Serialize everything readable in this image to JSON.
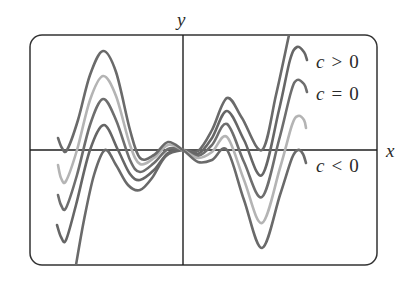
{
  "chart_data": {
    "type": "line",
    "title": "",
    "xlabel": "x",
    "ylabel": "y",
    "grid": false,
    "frame": {
      "x": 30,
      "y": 35,
      "width": 347,
      "height": 230,
      "radius": 12,
      "color": "#333333"
    },
    "origin_px": {
      "x": 183,
      "y": 150
    },
    "annotations": [
      {
        "text_var": "c",
        "op": ">",
        "value": "0",
        "x": 316,
        "y": 68
      },
      {
        "text_var": "c",
        "op": "=",
        "value": "0",
        "x": 316,
        "y": 100
      },
      {
        "text_var": "c",
        "op": "<",
        "value": "0",
        "x": 316,
        "y": 172
      }
    ],
    "axis_labels": {
      "x": {
        "text": "x",
        "x": 386,
        "y": 157
      },
      "y": {
        "text": "y",
        "x": 177,
        "y": 26
      }
    },
    "series": [
      {
        "name": "c > 0 (largest)",
        "color": "#6a6a6a",
        "points": [
          [
            76,
            265
          ],
          [
            84,
            220
          ],
          [
            94,
            175
          ],
          [
            105,
            150
          ],
          [
            116,
            165
          ],
          [
            128,
            185
          ],
          [
            140,
            190
          ],
          [
            152,
            178
          ],
          [
            166,
            156
          ],
          [
            183,
            150
          ],
          [
            198,
            151
          ],
          [
            212,
            130
          ],
          [
            227,
            98
          ],
          [
            242,
            118
          ],
          [
            262,
            150
          ],
          [
            276,
            95
          ],
          [
            289,
            35
          ]
        ]
      },
      {
        "name": "c > 0",
        "color": "#666666",
        "points": [
          [
            57,
            225
          ],
          [
            61,
            237
          ],
          [
            66,
            240
          ],
          [
            76,
            205
          ],
          [
            90,
            150
          ],
          [
            104,
            125
          ],
          [
            118,
            150
          ],
          [
            130,
            174
          ],
          [
            140,
            180
          ],
          [
            154,
            170
          ],
          [
            168,
            153
          ],
          [
            183,
            150
          ],
          [
            198,
            154
          ],
          [
            212,
            138
          ],
          [
            227,
            111
          ],
          [
            244,
            140
          ],
          [
            262,
            175
          ],
          [
            279,
            110
          ],
          [
            290,
            60
          ],
          [
            297,
            47
          ],
          [
            304,
            52
          ],
          [
            307,
            60
          ]
        ]
      },
      {
        "name": "c = 0",
        "color": "#6e6e6e",
        "points": [
          [
            58,
            195
          ],
          [
            61,
            205
          ],
          [
            66,
            208
          ],
          [
            77,
            175
          ],
          [
            90,
            125
          ],
          [
            103,
            99
          ],
          [
            116,
            120
          ],
          [
            130,
            160
          ],
          [
            140,
            172
          ],
          [
            154,
            163
          ],
          [
            168,
            149
          ],
          [
            183,
            150
          ],
          [
            198,
            156
          ],
          [
            212,
            145
          ],
          [
            227,
            124
          ],
          [
            244,
            162
          ],
          [
            262,
            197
          ],
          [
            279,
            140
          ],
          [
            291,
            92
          ],
          [
            297,
            80
          ],
          [
            304,
            84
          ],
          [
            307,
            92
          ]
        ]
      },
      {
        "name": "c < 0",
        "color": "#b4b4b4",
        "points": [
          [
            58,
            165
          ],
          [
            61,
            178
          ],
          [
            66,
            181
          ],
          [
            77,
            150
          ],
          [
            90,
            100
          ],
          [
            103,
            76
          ],
          [
            116,
            96
          ],
          [
            130,
            145
          ],
          [
            140,
            164
          ],
          [
            154,
            158
          ],
          [
            168,
            145
          ],
          [
            183,
            150
          ],
          [
            198,
            158
          ],
          [
            212,
            152
          ],
          [
            227,
            137
          ],
          [
            244,
            180
          ],
          [
            262,
            223
          ],
          [
            280,
            168
          ],
          [
            292,
            125
          ],
          [
            298,
            116
          ],
          [
            304,
            120
          ],
          [
            306,
            128
          ]
        ]
      },
      {
        "name": "c < 0 (most negative)",
        "color": "#6a6a6a",
        "points": [
          [
            58,
            138
          ],
          [
            62,
            148
          ],
          [
            67,
            150
          ],
          [
            78,
            120
          ],
          [
            90,
            75
          ],
          [
            103,
            51
          ],
          [
            116,
            72
          ],
          [
            130,
            130
          ],
          [
            140,
            158
          ],
          [
            154,
            155
          ],
          [
            168,
            142
          ],
          [
            183,
            150
          ],
          [
            198,
            162
          ],
          [
            212,
            160
          ],
          [
            227,
            150
          ],
          [
            244,
            200
          ],
          [
            262,
            248
          ],
          [
            280,
            195
          ],
          [
            292,
            158
          ],
          [
            298,
            150
          ],
          [
            303,
            154
          ],
          [
            306,
            163
          ]
        ]
      }
    ]
  }
}
